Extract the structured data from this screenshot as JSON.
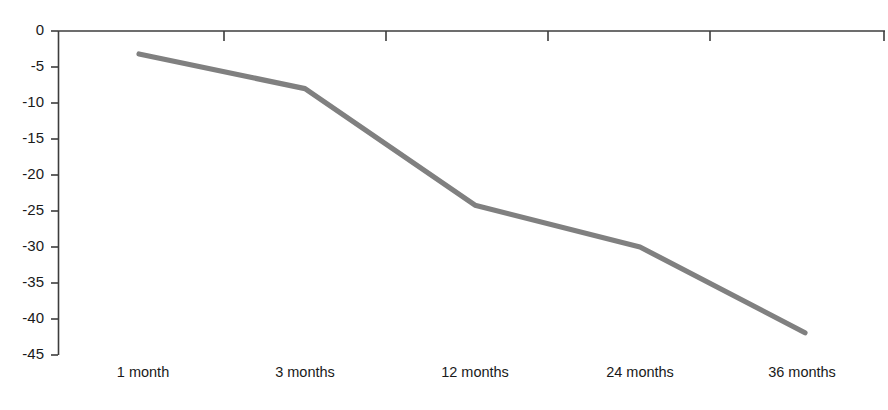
{
  "chart_data": {
    "type": "line",
    "title": "",
    "subtitle": "",
    "xlabel": "",
    "ylabel": "",
    "categories": [
      "1 month",
      "3 months",
      "12 months",
      "24 months",
      "36 months"
    ],
    "values": [
      -3.2,
      -8,
      -24.2,
      -30,
      -41.9
    ],
    "series": [
      {
        "name": "",
        "values": [
          -3.2,
          -8,
          -24.2,
          -30,
          -41.9
        ],
        "color": "#808080"
      }
    ],
    "ylim": [
      -45,
      0
    ],
    "ytick_labels": [
      "0",
      "-5",
      "-10",
      "-15",
      "-20",
      "-25",
      "-30",
      "-35",
      "-40",
      "-45"
    ],
    "ytick_values": [
      0,
      -5,
      -10,
      -15,
      -20,
      -25,
      -30,
      -35,
      -40,
      -45
    ],
    "grid": false,
    "legend": "none",
    "axis_color": "#3d3d3d",
    "line_color": "#808080",
    "background": "#ffffff"
  },
  "axes": {
    "y_axis_name": "value-axis",
    "x_axis_name": "category-axis"
  }
}
